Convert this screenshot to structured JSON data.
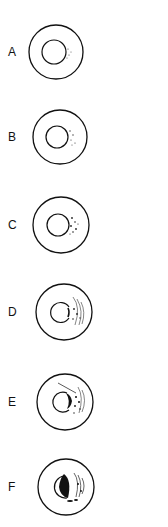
{
  "figure": {
    "panels": [
      {
        "label": "A",
        "stage": 1,
        "cy": 52
      },
      {
        "label": "B",
        "stage": 2,
        "cy": 137
      },
      {
        "label": "C",
        "stage": 3,
        "cy": 225
      },
      {
        "label": "D",
        "stage": 4,
        "cy": 312
      },
      {
        "label": "E",
        "stage": 5,
        "cy": 402
      },
      {
        "label": "F",
        "stage": 6,
        "cy": 487
      }
    ]
  },
  "colors": {
    "ink": "#111111",
    "background": "#ffffff"
  }
}
